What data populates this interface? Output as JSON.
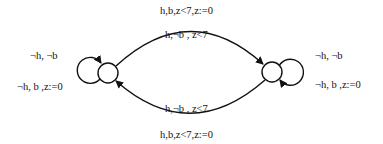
{
  "diagram": {
    "type": "state-machine",
    "states": [
      {
        "id": "s0",
        "label": ""
      },
      {
        "id": "s1",
        "label": ""
      }
    ],
    "transitions": {
      "top_outer": "h,b,z<7,z:=0",
      "top_inner": "h,¬b , z<7",
      "bottom_inner": "h,¬b , z<7",
      "bottom_outer": "h,b,z<7,z:=0",
      "left_loop_1": "¬h, ¬b",
      "left_loop_2": "¬h, b ,z:=0",
      "right_loop_1": "¬h, ¬b",
      "right_loop_2": "¬h, b ,z:=0"
    },
    "colors": {
      "stroke": "#111111",
      "background": "#ffffff"
    }
  }
}
